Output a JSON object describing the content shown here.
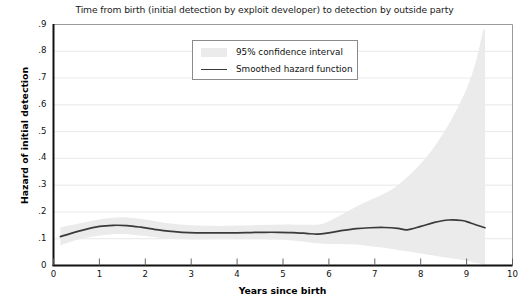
{
  "chart_data": {
    "type": "line",
    "title": "Time from birth (initial detection by exploit developer) to detection by outside party",
    "xlabel": "Years since birth",
    "ylabel": "Hazard of initial detection",
    "xlim": [
      0,
      10
    ],
    "ylim": [
      0,
      0.9
    ],
    "grid": "horizontal",
    "legend_position": "top-center",
    "xticks": [
      "0",
      "1",
      "2",
      "3",
      "4",
      "5",
      "6",
      "7",
      "8",
      "9",
      "10"
    ],
    "xtick_values": [
      0,
      1,
      2,
      3,
      4,
      5,
      6,
      7,
      8,
      9,
      10
    ],
    "yticks": [
      "0",
      ".1",
      ".2",
      ".3",
      ".4",
      ".5",
      ".6",
      ".7",
      ".8",
      ".9"
    ],
    "ytick_values": [
      0,
      0.1,
      0.2,
      0.3,
      0.4,
      0.5,
      0.6,
      0.7,
      0.8,
      0.9
    ],
    "legend": [
      {
        "label": "95% confidence interval",
        "marker": "band",
        "color": "#ebebeb"
      },
      {
        "label": "Smoothed hazard function",
        "marker": "line",
        "color": "#3a3a3a"
      }
    ],
    "series": [
      {
        "name": "Smoothed hazard function",
        "color": "#3a3a3a",
        "x": [
          0.15,
          0.4,
          0.7,
          1.0,
          1.3,
          1.6,
          1.9,
          2.2,
          2.5,
          2.8,
          3.1,
          3.4,
          3.7,
          4.0,
          4.3,
          4.6,
          4.9,
          5.2,
          5.5,
          5.75,
          6.0,
          6.3,
          6.6,
          6.9,
          7.2,
          7.5,
          7.7,
          8.0,
          8.3,
          8.6,
          8.9,
          9.1,
          9.4
        ],
        "values": [
          0.108,
          0.121,
          0.135,
          0.146,
          0.15,
          0.149,
          0.143,
          0.135,
          0.128,
          0.124,
          0.122,
          0.122,
          0.122,
          0.122,
          0.123,
          0.124,
          0.124,
          0.123,
          0.12,
          0.117,
          0.122,
          0.131,
          0.138,
          0.141,
          0.142,
          0.139,
          0.133,
          0.146,
          0.161,
          0.17,
          0.168,
          0.158,
          0.141
        ]
      }
    ],
    "confidence_band": {
      "name": "95% confidence interval",
      "color": "#ebebeb",
      "x": [
        0.15,
        0.5,
        1.0,
        1.5,
        2.0,
        2.5,
        3.0,
        3.5,
        4.0,
        4.5,
        5.0,
        5.5,
        5.8,
        6.0,
        6.3,
        6.6,
        6.9,
        7.2,
        7.5,
        7.8,
        8.1,
        8.4,
        8.7,
        9.0,
        9.2,
        9.35,
        9.4
      ],
      "lower": [
        0.075,
        0.095,
        0.112,
        0.118,
        0.11,
        0.1,
        0.097,
        0.098,
        0.098,
        0.098,
        0.096,
        0.088,
        0.082,
        0.08,
        0.08,
        0.078,
        0.072,
        0.066,
        0.058,
        0.05,
        0.042,
        0.034,
        0.026,
        0.018,
        0.01,
        0.004,
        0.0
      ],
      "upper": [
        0.143,
        0.155,
        0.172,
        0.18,
        0.172,
        0.158,
        0.15,
        0.148,
        0.149,
        0.151,
        0.153,
        0.152,
        0.153,
        0.165,
        0.192,
        0.22,
        0.245,
        0.268,
        0.3,
        0.345,
        0.4,
        0.47,
        0.555,
        0.66,
        0.76,
        0.87,
        0.88
      ]
    }
  }
}
